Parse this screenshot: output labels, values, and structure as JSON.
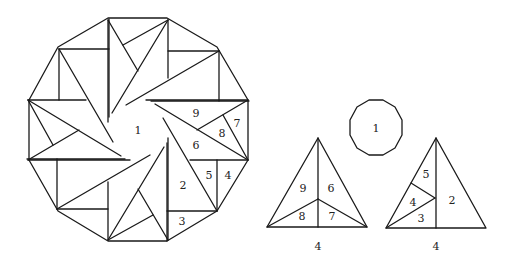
{
  "big_dodecagon": {
    "labels": {
      "center": "1",
      "l9": "9",
      "l8": "8",
      "l7": "7",
      "l6": "6",
      "l5": "5",
      "l4": "4",
      "l2": "2",
      "l3": "3"
    }
  },
  "small_dodecagon": {
    "label": "1"
  },
  "triangle_left": {
    "pieces": [
      "9",
      "6",
      "8",
      "7"
    ],
    "base_label": "4"
  },
  "triangle_right": {
    "pieces": [
      "5",
      "4",
      "3",
      "2"
    ],
    "base_label": "4"
  }
}
